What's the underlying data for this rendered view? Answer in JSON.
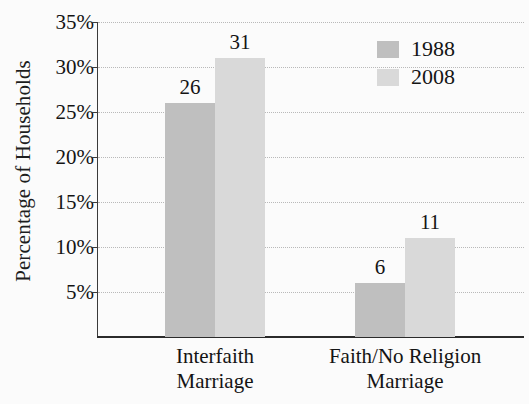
{
  "chart_data": {
    "type": "bar",
    "title": "",
    "xlabel": "",
    "ylabel": "Percentage of Households",
    "categories": [
      "Interfaith Marriage",
      "Faith/No Religion Marriage"
    ],
    "category_lines": [
      [
        "Interfaith",
        "Marriage"
      ],
      [
        "Faith/No Religion",
        "Marriage"
      ]
    ],
    "series": [
      {
        "name": "1988",
        "values": [
          26,
          31
        ]
      },
      {
        "name": "2008",
        "values": [
          6,
          11
        ]
      }
    ],
    "series_by_group": [
      {
        "category": "Interfaith Marriage",
        "1988": 26,
        "2008": 31
      },
      {
        "category": "Faith/No Religion Marriage",
        "1988": 6,
        "2008": 11
      }
    ],
    "bar_labels": [
      "26",
      "31",
      "6",
      "11"
    ],
    "ylim": [
      0,
      35
    ],
    "ytick_values": [
      35,
      30,
      25,
      20,
      15,
      10,
      5
    ],
    "ytick_labels": [
      "35%",
      "30%",
      "25%",
      "20%",
      "15%",
      "10%",
      "5%"
    ],
    "grid": true,
    "grid_style": "dotted",
    "legend_position": "top-right",
    "colors": {
      "series_1988": "#bfbfbf",
      "series_2008": "#d9d9d9",
      "background": "#fbfbfb",
      "axis": "#2b2b2b",
      "gridline": "#b9b9b9",
      "text": "#141414"
    }
  },
  "legend": {
    "entries": [
      {
        "label": "1988",
        "swatch": "#bfbfbf"
      },
      {
        "label": "2008",
        "swatch": "#d9d9d9"
      }
    ]
  }
}
